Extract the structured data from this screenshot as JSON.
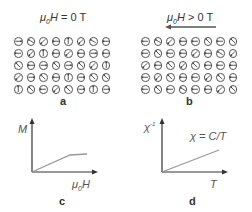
{
  "panels": {
    "a": {
      "label": "a",
      "title_prefix": "μ",
      "title_sub": "0",
      "title_rest": "H = 0 T",
      "spin_angles_deg": [
        [
          0,
          150,
          225,
          180,
          90,
          225,
          150,
          180
        ],
        [
          180,
          225,
          90,
          180,
          225,
          180,
          0,
          180
        ],
        [
          135,
          180,
          0,
          135,
          0,
          135,
          225,
          90
        ],
        [
          225,
          0,
          135,
          180,
          90,
          0,
          135,
          135
        ],
        [
          90,
          135,
          180,
          225,
          135,
          0,
          90,
          0
        ]
      ]
    },
    "b": {
      "label": "b",
      "title_prefix": "μ",
      "title_sub": "0",
      "title_rest": "H > 0 T",
      "field_arrow": "left",
      "spin_angles_deg": [
        [
          180,
          150,
          225,
          180,
          180,
          135,
          180,
          135
        ],
        [
          180,
          135,
          180,
          180,
          225,
          180,
          150,
          225
        ],
        [
          225,
          180,
          135,
          225,
          135,
          180,
          180,
          180
        ],
        [
          180,
          225,
          135,
          180,
          180,
          225,
          135,
          180
        ],
        [
          180,
          135,
          180,
          150,
          180,
          180,
          225,
          135
        ]
      ]
    },
    "c": {
      "label": "c",
      "y_label": "M",
      "x_label_prefix": "μ",
      "x_label_sub": "0",
      "x_label_rest": "H"
    },
    "d": {
      "label": "d",
      "y_label": "χ",
      "y_label_sup": "-1",
      "x_label": "T",
      "annotation": "χ = C/T"
    }
  },
  "colors": {
    "line": "#999999",
    "axis": "#333333",
    "circle": "#555555"
  }
}
